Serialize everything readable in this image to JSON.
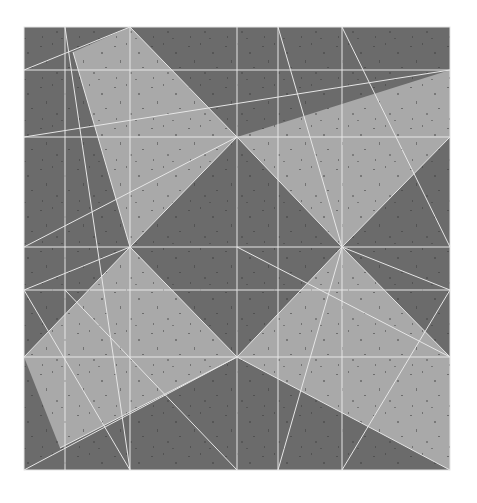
{
  "artwork": {
    "background": "#ffffff",
    "dark_tone": "#6b6b6b",
    "light_tone": "#a9a9a9",
    "line_color": "#e6e6e6",
    "frame": {
      "x": 24,
      "y": 27,
      "w": 426,
      "h": 443
    },
    "light_shapes": [
      {
        "name": "light-quad-top-left",
        "points": "130,27 237,137 130,247 73,52"
      },
      {
        "name": "light-quad-top-right",
        "points": "237,137 450,70 450,137 342,247"
      },
      {
        "name": "light-quad-left",
        "points": "130,247 237,357 60,448 24,357"
      },
      {
        "name": "light-quad-right",
        "points": "342,247 450,357 450,470 237,357"
      }
    ],
    "pencil_marks": {
      "edition": "",
      "title": "",
      "signature": ""
    }
  }
}
